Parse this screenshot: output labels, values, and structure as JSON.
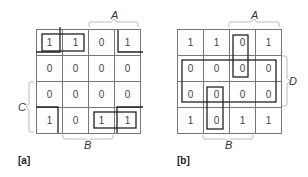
{
  "figure": {
    "maps": [
      {
        "id": "a",
        "caption": "[a]",
        "cells": [
          [
            "1",
            "1",
            "0",
            "1"
          ],
          [
            "0",
            "0",
            "0",
            "0"
          ],
          [
            "0",
            "0",
            "0",
            "0"
          ],
          [
            "1",
            "0",
            "1",
            "1"
          ]
        ],
        "variable_labels": {
          "top": "A",
          "left": "C",
          "bottom": "B"
        },
        "groupings": [
          {
            "type": "box",
            "cells": [
              [
                0,
                0
              ],
              [
                0,
                1
              ]
            ]
          },
          {
            "type": "corners",
            "cells": [
              [
                0,
                0
              ],
              [
                0,
                3
              ],
              [
                3,
                0
              ],
              [
                3,
                3
              ]
            ]
          },
          {
            "type": "box",
            "cells": [
              [
                3,
                2
              ],
              [
                3,
                3
              ]
            ]
          }
        ]
      },
      {
        "id": "b",
        "caption": "[b]",
        "cells": [
          [
            "1",
            "1",
            "0",
            "1"
          ],
          [
            "0",
            "0",
            "0",
            "0"
          ],
          [
            "0",
            "0",
            "0",
            "0"
          ],
          [
            "1",
            "0",
            "1",
            "1"
          ]
        ],
        "variable_labels": {
          "top": "A",
          "right": "D",
          "bottom": "B"
        },
        "groupings": [
          {
            "type": "box",
            "cells": [
              [
                0,
                2
              ],
              [
                1,
                2
              ]
            ]
          },
          {
            "type": "box",
            "cells": [
              [
                1,
                0
              ],
              [
                1,
                1
              ],
              [
                1,
                2
              ],
              [
                1,
                3
              ],
              [
                2,
                0
              ],
              [
                2,
                1
              ],
              [
                2,
                2
              ],
              [
                2,
                3
              ]
            ]
          },
          {
            "type": "box",
            "cells": [
              [
                2,
                1
              ],
              [
                3,
                1
              ]
            ]
          }
        ]
      }
    ]
  }
}
